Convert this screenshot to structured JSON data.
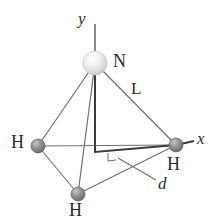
{
  "figure": {
    "background_color": "#ffffff",
    "width": 217,
    "height": 220
  },
  "colors": {
    "nitrogen_sphere": "#e8e8e8",
    "nitrogen_sphere_highlight": "#ffffff",
    "nitrogen_sphere_edge": "#bdbdbd",
    "hydrogen_sphere": "#8d8d8d",
    "hydrogen_sphere_highlight": "#c9c9c9",
    "hydrogen_sphere_edge": "#5f5f5f",
    "bond_line": "#6e6e6e",
    "axis_line": "#4a4a4a",
    "heavy_line": "#3a3a3a",
    "label_text": "#2b2b2b"
  },
  "axes": [
    {
      "name": "y-axis",
      "label": "y",
      "label_x": 78,
      "label_y": 10,
      "from_x": 95,
      "from_y": 24,
      "to_x": 95,
      "to_y": 57
    },
    {
      "name": "x-axis",
      "label": "x",
      "label_x": 196,
      "label_y": 132,
      "from_x": 176,
      "from_y": 145,
      "to_x": 194,
      "to_y": 142
    }
  ],
  "atoms": [
    {
      "name": "nitrogen",
      "element": "N",
      "label": "N",
      "cx": 95,
      "cy": 63,
      "r": 12,
      "kind": "nitrogen",
      "label_x": 113,
      "label_y": 54
    },
    {
      "name": "hydrogen-left",
      "element": "H",
      "label": "H",
      "cx": 38,
      "cy": 146,
      "r": 7,
      "kind": "hydrogen",
      "label_x": 12,
      "label_y": 136
    },
    {
      "name": "hydrogen-right",
      "element": "H",
      "label": "H",
      "cx": 176,
      "cy": 145,
      "r": 7,
      "kind": "hydrogen",
      "label_x": 165,
      "label_y": 157
    },
    {
      "name": "hydrogen-bottom",
      "element": "H",
      "label": "H",
      "cx": 78,
      "cy": 194,
      "r": 7,
      "kind": "hydrogen",
      "label_x": 68,
      "label_y": 203
    }
  ],
  "bonds": [
    {
      "name": "bond-n-to-h-left",
      "from": "nitrogen",
      "to": "hydrogen-left"
    },
    {
      "name": "bond-n-to-h-right",
      "from": "nitrogen",
      "to": "hydrogen-right"
    },
    {
      "name": "bond-n-to-h-bottom",
      "from": "nitrogen",
      "to": "hydrogen-bottom"
    }
  ],
  "base_edges": [
    {
      "name": "edge-h-left-to-h-right",
      "from": "hydrogen-left",
      "to": "hydrogen-right"
    },
    {
      "name": "edge-h-left-to-h-bottom",
      "from": "hydrogen-left",
      "to": "hydrogen-bottom"
    },
    {
      "name": "edge-h-bottom-to-h-right",
      "from": "hydrogen-bottom",
      "to": "hydrogen-right"
    }
  ],
  "annotations": {
    "bond_length": {
      "name": "bond-length-label",
      "label": "L",
      "label_x": 131,
      "label_y": 85,
      "describes": "bond-n-to-h-right"
    },
    "perpendicular_distance": {
      "name": "perpendicular-distance-label",
      "label": "d",
      "label_x": 160,
      "label_y": 184,
      "leader_from_x": 118,
      "leader_from_y": 158,
      "leader_to_x": 156,
      "leader_to_y": 180
    },
    "height_drop": {
      "name": "height-drop-line",
      "from_x": 95,
      "from_y": 63,
      "corner_x": 95,
      "corner_y": 152,
      "to_x": 176,
      "to_y": 145
    },
    "right_angle_marker": {
      "name": "right-angle-marker",
      "visible": true
    }
  }
}
